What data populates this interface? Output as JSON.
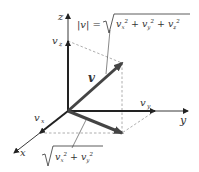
{
  "diagram": {
    "axes": {
      "x": "x",
      "y": "y",
      "z": "z"
    },
    "components": {
      "vx": "v",
      "vx_sub": "x",
      "vy": "v",
      "vy_sub": "y",
      "vz": "v",
      "vz_sub": "z"
    },
    "vector_label": "v",
    "magnitude_formula": {
      "lhs": "|v| =",
      "rhs_terms": [
        "vx²",
        "vy²",
        "vz²"
      ],
      "plus": "+"
    },
    "projection_formula": {
      "rhs_terms": [
        "vx²",
        "vy²"
      ],
      "plus": "+"
    },
    "colors": {
      "axis": "#222222",
      "vector": "#444444",
      "dashed": "#999999",
      "text": "#333333"
    }
  }
}
